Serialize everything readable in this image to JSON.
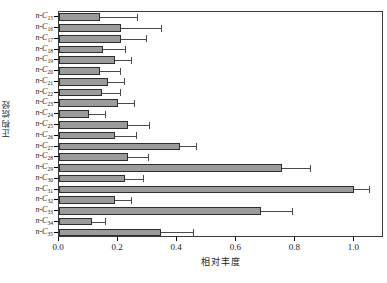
{
  "chart_data": {
    "type": "bar",
    "orientation": "horizontal",
    "title": "",
    "xlabel": "相对丰度",
    "ylabel": "正构烷烃",
    "xlim": [
      0.0,
      1.1
    ],
    "xticks": [
      0.0,
      0.2,
      0.4,
      0.6,
      0.8,
      1.0
    ],
    "xticklabels": [
      "0.0",
      "0.2",
      "0.4",
      "0.6",
      "0.8",
      "1.0"
    ],
    "grid": false,
    "legend": null,
    "categories": [
      "n-C15",
      "n-C16",
      "n-C17",
      "n-C18",
      "n-C19",
      "n-C20",
      "n-C21",
      "n-C22",
      "n-C23",
      "n-C24",
      "n-C25",
      "n-C26",
      "n-C27",
      "n-C28",
      "n-C29",
      "n-C30",
      "n-C31",
      "n-C32",
      "n-C33",
      "n-C34",
      "n-C35"
    ],
    "category_labels": [
      {
        "prefix": "n-C",
        "sub": "15"
      },
      {
        "prefix": "n-C",
        "sub": "16"
      },
      {
        "prefix": "n-C",
        "sub": "17"
      },
      {
        "prefix": "n-C",
        "sub": "18"
      },
      {
        "prefix": "n-C",
        "sub": "19"
      },
      {
        "prefix": "n-C",
        "sub": "20"
      },
      {
        "prefix": "n-C",
        "sub": "21"
      },
      {
        "prefix": "n-C",
        "sub": "22"
      },
      {
        "prefix": "n-C",
        "sub": "23"
      },
      {
        "prefix": "n-C",
        "sub": "24"
      },
      {
        "prefix": "n-C",
        "sub": "25"
      },
      {
        "prefix": "n-C",
        "sub": "26"
      },
      {
        "prefix": "n-C",
        "sub": "27"
      },
      {
        "prefix": "n-C",
        "sub": "28"
      },
      {
        "prefix": "n-C",
        "sub": "29"
      },
      {
        "prefix": "n-C",
        "sub": "30"
      },
      {
        "prefix": "n-C",
        "sub": "31"
      },
      {
        "prefix": "n-C",
        "sub": "32"
      },
      {
        "prefix": "n-C",
        "sub": "33"
      },
      {
        "prefix": "n-C",
        "sub": "34"
      },
      {
        "prefix": "n-C",
        "sub": "35"
      }
    ],
    "values": [
      0.14,
      0.21,
      0.21,
      0.15,
      0.19,
      0.14,
      0.165,
      0.145,
      0.2,
      0.1,
      0.235,
      0.19,
      0.41,
      0.235,
      0.755,
      0.225,
      1.0,
      0.19,
      0.685,
      0.11,
      0.345
    ],
    "errors_high": [
      0.265,
      0.345,
      0.295,
      0.225,
      0.245,
      0.205,
      0.22,
      0.205,
      0.255,
      0.155,
      0.305,
      0.26,
      0.465,
      0.3,
      0.85,
      0.285,
      1.05,
      0.245,
      0.79,
      0.155,
      0.455
    ],
    "bar_color": "#9b9b9b",
    "bar_edge_color": "#2e2e2e",
    "error_color": "#4a4a4a",
    "frame_color": "#3a3a3a"
  }
}
